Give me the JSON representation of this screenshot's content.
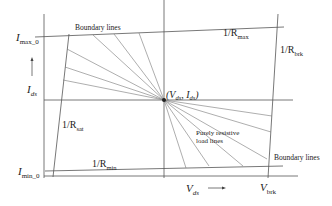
{
  "diagram": {
    "labels": {
      "boundary_top": "Boundary lines",
      "boundary_bottom": "Boundary lines",
      "imax": "I",
      "imax_sub": "max_0",
      "imin": "I",
      "imin_sub": "min_0",
      "ids": "I",
      "ids_sub": "ds",
      "vds": "V",
      "vds_sub": "ds",
      "vbrk": "V",
      "vbrk_sub": "brk",
      "rmax": "1/R",
      "rmax_sub": "max",
      "rbrk": "1/R",
      "rbrk_sub": "brk",
      "rsat": "1/R",
      "rsat_sub": "sat",
      "rmin": "1/R",
      "rmin_sub": "min",
      "point": "(V",
      "point_sub1": "ds",
      "point_mid": ", I",
      "point_sub2": "ds",
      "point_end": ")",
      "load_line_1": "Purely resistive",
      "load_line_2": "load lines"
    },
    "colors": {
      "line": "#555555",
      "text": "#222222",
      "background": "#ffffff"
    }
  }
}
